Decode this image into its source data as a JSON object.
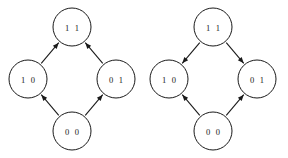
{
  "figure": {
    "background_color": "#ffffff",
    "stroke_color": "#1a1a1a",
    "width": 288,
    "height": 158
  },
  "diagrams": [
    {
      "id": "left-lattice",
      "name": "left-state-diagram",
      "center_x": 72,
      "nodes": [
        {
          "id": "L-11",
          "label": "1 1",
          "cx": 72,
          "cy": 27,
          "r": 19
        },
        {
          "id": "L-10",
          "label": "1 0",
          "cx": 28,
          "cy": 79,
          "r": 19
        },
        {
          "id": "L-01",
          "label": "0 1",
          "cx": 116,
          "cy": 79,
          "r": 19
        },
        {
          "id": "L-00",
          "label": "0 0",
          "cx": 72,
          "cy": 131,
          "r": 19
        }
      ],
      "edges": [
        {
          "id": "L-e1",
          "from": "L-00",
          "to": "L-10",
          "direction": "upward"
        },
        {
          "id": "L-e2",
          "from": "L-00",
          "to": "L-01",
          "direction": "upward"
        },
        {
          "id": "L-e3",
          "from": "L-10",
          "to": "L-11",
          "direction": "upward"
        },
        {
          "id": "L-e4",
          "from": "L-01",
          "to": "L-11",
          "direction": "upward"
        }
      ]
    },
    {
      "id": "right-lattice",
      "name": "right-state-diagram",
      "center_x": 213,
      "nodes": [
        {
          "id": "R-11",
          "label": "1 1",
          "cx": 213,
          "cy": 27,
          "r": 19
        },
        {
          "id": "R-10",
          "label": "1 0",
          "cx": 169,
          "cy": 79,
          "r": 19
        },
        {
          "id": "R-01",
          "label": "0 1",
          "cx": 257,
          "cy": 79,
          "r": 19
        },
        {
          "id": "R-00",
          "label": "0 0",
          "cx": 213,
          "cy": 131,
          "r": 19
        }
      ],
      "edges": [
        {
          "id": "R-e1",
          "from": "R-00",
          "to": "R-10",
          "direction": "upward"
        },
        {
          "id": "R-e2",
          "from": "R-00",
          "to": "R-01",
          "direction": "upward"
        },
        {
          "id": "R-e3",
          "from": "R-11",
          "to": "R-10",
          "direction": "downward"
        },
        {
          "id": "R-e4",
          "from": "R-11",
          "to": "R-01",
          "direction": "downward"
        }
      ]
    }
  ]
}
